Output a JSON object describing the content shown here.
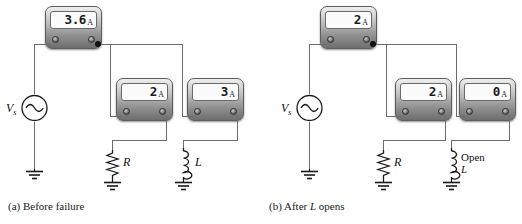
{
  "figure": {
    "wire_color": "#6b6b6b",
    "node_color": "#111111",
    "meter_body_color": "#8f8f8f",
    "screen_color": "#fbfbfb"
  },
  "panels": [
    {
      "id": "a",
      "caption_prefix": "(a)",
      "caption_text": "Before failure",
      "source": {
        "label": "V",
        "subscript": "s",
        "symbol": "ac-source-icon"
      },
      "meters": [
        {
          "name": "total-current-meter",
          "value": "3.6",
          "unit": "A",
          "role": "total"
        },
        {
          "name": "resistor-branch-meter",
          "value": "2",
          "unit": "A",
          "role": "resistor-branch"
        },
        {
          "name": "inductor-branch-meter",
          "value": "3",
          "unit": "A",
          "role": "inductor-branch"
        }
      ],
      "components": [
        {
          "name": "resistor",
          "label": "R",
          "symbol": "resistor-icon"
        },
        {
          "name": "inductor",
          "label": "L",
          "symbol": "inductor-icon",
          "note": ""
        }
      ]
    },
    {
      "id": "b",
      "caption_prefix": "(b)",
      "caption_text_before": "After ",
      "caption_italic": "L",
      "caption_text_after": " opens",
      "source": {
        "label": "V",
        "subscript": "s",
        "symbol": "ac-source-icon"
      },
      "meters": [
        {
          "name": "total-current-meter",
          "value": "2",
          "unit": "A",
          "role": "total"
        },
        {
          "name": "resistor-branch-meter",
          "value": "2",
          "unit": "A",
          "role": "resistor-branch"
        },
        {
          "name": "inductor-branch-meter",
          "value": "0",
          "unit": "A",
          "role": "inductor-branch"
        }
      ],
      "components": [
        {
          "name": "resistor",
          "label": "R",
          "symbol": "resistor-icon"
        },
        {
          "name": "inductor",
          "label": "L",
          "symbol": "inductor-icon",
          "note": "Open"
        }
      ]
    }
  ]
}
